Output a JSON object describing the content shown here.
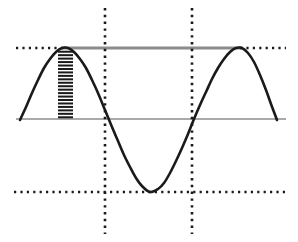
{
  "figure": {
    "title": "",
    "width": 298,
    "height": 242,
    "background": "#ffffff"
  },
  "chart_data": {
    "type": "line",
    "title": "",
    "subtitle": "",
    "xlabel": "",
    "ylabel": "",
    "grid": true,
    "legend": null,
    "legend_position": "none",
    "axis_style": "dotted-guides",
    "xlim": [
      0,
      298
    ],
    "ylim": [
      242,
      0
    ],
    "plot_area": {
      "x0": 20,
      "x1": 277,
      "y_top": 48,
      "y_mid": 119,
      "y_bottom": 192
    },
    "series": [
      {
        "name": "sine-wave",
        "color": "#1a1a1a",
        "linewidth": 2.6,
        "type": "line",
        "description": "one and a half period sinusoid",
        "amplitude": 71,
        "midline_y": 119,
        "peak_y": 48,
        "trough_y": 192,
        "period_px": 177,
        "phase_x_at_midline_rising": 19,
        "points": [
          {
            "x": 20,
            "y": 120
          },
          {
            "x": 26,
            "y": 107
          },
          {
            "x": 32,
            "y": 93
          },
          {
            "x": 38,
            "y": 80
          },
          {
            "x": 44,
            "y": 68
          },
          {
            "x": 50,
            "y": 59
          },
          {
            "x": 56,
            "y": 52
          },
          {
            "x": 62,
            "y": 48
          },
          {
            "x": 68,
            "y": 48
          },
          {
            "x": 74,
            "y": 52
          },
          {
            "x": 80,
            "y": 59
          },
          {
            "x": 86,
            "y": 68
          },
          {
            "x": 92,
            "y": 80
          },
          {
            "x": 98,
            "y": 93
          },
          {
            "x": 105,
            "y": 110
          },
          {
            "x": 112,
            "y": 127
          },
          {
            "x": 118,
            "y": 141
          },
          {
            "x": 124,
            "y": 155
          },
          {
            "x": 130,
            "y": 167
          },
          {
            "x": 136,
            "y": 178
          },
          {
            "x": 142,
            "y": 186
          },
          {
            "x": 150,
            "y": 192
          },
          {
            "x": 158,
            "y": 189
          },
          {
            "x": 164,
            "y": 183
          },
          {
            "x": 170,
            "y": 173
          },
          {
            "x": 176,
            "y": 161
          },
          {
            "x": 182,
            "y": 148
          },
          {
            "x": 188,
            "y": 134
          },
          {
            "x": 194,
            "y": 119
          },
          {
            "x": 200,
            "y": 105
          },
          {
            "x": 206,
            "y": 92
          },
          {
            "x": 212,
            "y": 79
          },
          {
            "x": 218,
            "y": 68
          },
          {
            "x": 224,
            "y": 59
          },
          {
            "x": 230,
            "y": 52
          },
          {
            "x": 236,
            "y": 48
          },
          {
            "x": 242,
            "y": 48
          },
          {
            "x": 248,
            "y": 53
          },
          {
            "x": 254,
            "y": 62
          },
          {
            "x": 260,
            "y": 75
          },
          {
            "x": 266,
            "y": 90
          },
          {
            "x": 271,
            "y": 104
          },
          {
            "x": 277,
            "y": 120
          }
        ]
      }
    ],
    "guides": [
      {
        "name": "peak-guide-dotted-left",
        "orientation": "horizontal",
        "style": "dotted",
        "color": "#1a1a1a",
        "y": 48,
        "x_start": 16,
        "x_end": 64
      },
      {
        "name": "peak-guide-solid-gray",
        "orientation": "horizontal",
        "style": "solid",
        "color": "#8c8c8c",
        "y": 48,
        "x_start": 62,
        "x_end": 242,
        "linewidth": 3
      },
      {
        "name": "peak-guide-dotted-right",
        "orientation": "horizontal",
        "style": "dotted",
        "color": "#1a1a1a",
        "y": 48,
        "x_start": 240,
        "x_end": 286
      },
      {
        "name": "midline-axis",
        "orientation": "horizontal",
        "style": "solid",
        "color": "#8c8c8c",
        "y": 119,
        "x_start": 16,
        "x_end": 286,
        "linewidth": 1.5
      },
      {
        "name": "trough-guide-dotted",
        "orientation": "horizontal",
        "style": "dotted",
        "color": "#1a1a1a",
        "y": 192,
        "x_start": 14,
        "x_end": 286
      },
      {
        "name": "quarter-guide-vertical-left",
        "orientation": "vertical",
        "style": "dotted",
        "color": "#1a1a1a",
        "x": 105,
        "y_start": 8,
        "y_end": 234
      },
      {
        "name": "quarter-guide-vertical-right",
        "orientation": "vertical",
        "style": "dotted",
        "color": "#1a1a1a",
        "x": 192,
        "y_start": 8,
        "y_end": 234
      }
    ],
    "annotations": [
      {
        "name": "amplitude-hatch-band",
        "type": "hatched-region",
        "color": "#1a1a1a",
        "x_start": 58,
        "x_end": 73,
        "y_start": 50,
        "y_end": 119,
        "hatch": "horizontal-dashes",
        "dash_count": 20,
        "meaning": "amplitude measured from midline to peak"
      }
    ]
  }
}
